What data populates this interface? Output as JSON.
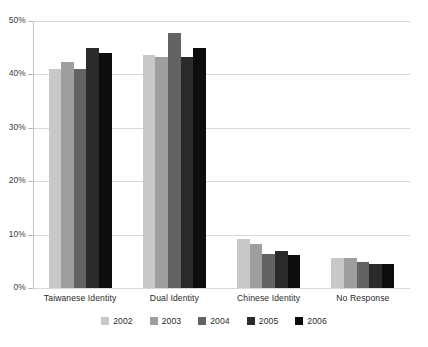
{
  "chart_data": {
    "type": "bar",
    "title": "",
    "subtitle": "",
    "xlabel": "",
    "ylabel": "",
    "ylim": [
      0,
      50
    ],
    "ytick_labels": [
      "50%",
      "40%",
      "30%",
      "20%",
      "10%",
      "0%"
    ],
    "ytick_values": [
      50,
      40,
      30,
      20,
      10,
      0
    ],
    "grid": true,
    "legend_position": "bottom",
    "categories": [
      "Taiwanese Identity",
      "Dual Identity",
      "Chinese Identity",
      "No Response"
    ],
    "series": [
      {
        "name": "2002",
        "color": "#c8c8c8",
        "values": [
          41.0,
          43.7,
          9.2,
          5.7
        ]
      },
      {
        "name": "2003",
        "color": "#9e9e9e",
        "values": [
          42.3,
          43.3,
          8.2,
          5.7
        ]
      },
      {
        "name": "2004",
        "color": "#636363",
        "values": [
          41.0,
          47.7,
          6.3,
          4.8
        ]
      },
      {
        "name": "2005",
        "color": "#2b2b2b",
        "values": [
          45.0,
          43.3,
          7.0,
          4.5
        ]
      },
      {
        "name": "2006",
        "color": "#0d0d0d",
        "values": [
          44.0,
          45.0,
          6.2,
          4.5
        ]
      }
    ]
  },
  "colors": {
    "background": "#ffffff",
    "gridline": "#d8d8d8",
    "axis": "#c4c4c4",
    "text": "#2a2a2a"
  }
}
